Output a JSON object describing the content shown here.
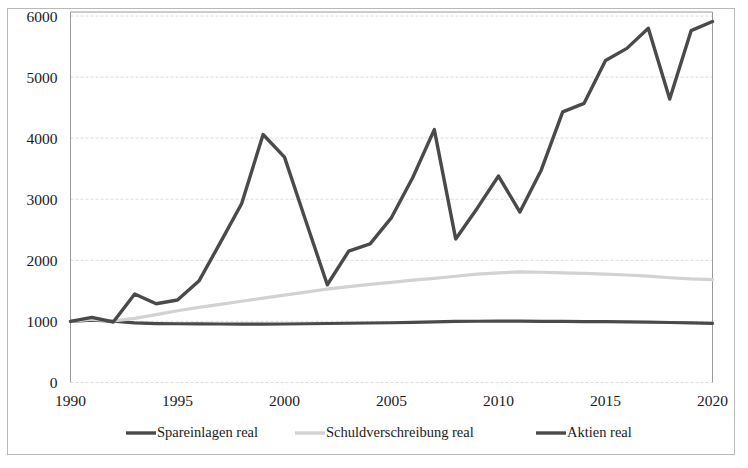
{
  "chart_data": {
    "type": "line",
    "title": "",
    "subtitle": "",
    "xlabel": "",
    "ylabel": "",
    "xlim": [
      1990,
      2020
    ],
    "ylim": [
      0,
      6000
    ],
    "ytick_values": [
      0,
      1000,
      2000,
      3000,
      4000,
      5000,
      6000
    ],
    "ytick_labels": [
      "0",
      "1000",
      "2000",
      "3000",
      "4000",
      "5000",
      "6000"
    ],
    "xtick_values": [
      1990,
      1995,
      2000,
      2005,
      2010,
      2015,
      2020
    ],
    "xtick_labels": [
      "1990",
      "1995",
      "2000",
      "2005",
      "2010",
      "2015",
      "2020"
    ],
    "grid": "horizontal",
    "legend_position": "bottom",
    "x": [
      1990,
      1991,
      1992,
      1993,
      1994,
      1995,
      1996,
      1997,
      1998,
      1999,
      2000,
      2001,
      2002,
      2003,
      2004,
      2005,
      2006,
      2007,
      2008,
      2009,
      2010,
      2011,
      2012,
      2013,
      2014,
      2015,
      2016,
      2017,
      2018,
      2019,
      2020
    ],
    "series": [
      {
        "name": "Spareinlagen real",
        "color": "#4a4a4a",
        "width": 3.2,
        "values": [
          1000,
          1020,
          1005,
          975,
          965,
          962,
          960,
          958,
          957,
          956,
          958,
          962,
          966,
          970,
          974,
          978,
          985,
          992,
          1000,
          1003,
          1005,
          1004,
          1002,
          1000,
          998,
          996,
          993,
          988,
          982,
          975,
          968
        ]
      },
      {
        "name": "Schuldverschreibung real",
        "color": "#d2d2d2",
        "width": 3.2,
        "values": [
          1000,
          1035,
          1010,
          1050,
          1110,
          1175,
          1230,
          1280,
          1330,
          1380,
          1430,
          1480,
          1530,
          1570,
          1605,
          1640,
          1675,
          1705,
          1740,
          1775,
          1795,
          1810,
          1805,
          1795,
          1785,
          1775,
          1760,
          1740,
          1715,
          1695,
          1685
        ]
      },
      {
        "name": "Aktien real",
        "color": "#4a4a4a",
        "width": 3.4,
        "values": [
          1000,
          1065,
          990,
          1450,
          1290,
          1350,
          1660,
          2290,
          2930,
          4060,
          3690,
          2640,
          1600,
          2150,
          2270,
          2700,
          3360,
          4140,
          2350,
          2850,
          3380,
          2790,
          3480,
          4430,
          4570,
          5270,
          5470,
          5800,
          4640,
          5760,
          5910
        ]
      }
    ]
  },
  "legend": {
    "items": [
      {
        "label": "Spareinlagen real",
        "color": "#4a4a4a"
      },
      {
        "label": "Schuldverschreibung real",
        "color": "#d2d2d2"
      },
      {
        "label": "Aktien real",
        "color": "#4a4a4a"
      }
    ]
  }
}
